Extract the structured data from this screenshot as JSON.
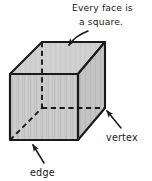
{
  "figure": {
    "shape_name": "cube",
    "projection": "oblique parallel projection",
    "background_color": "#ffffff",
    "ink_color": "#1a1a1a",
    "faces": {
      "front_fill": "#c9c9c9",
      "top_fill": "#cfcfcf",
      "right_fill": "#c2c2c2",
      "texture": "vertical pencil shading streaks"
    },
    "hidden_line_style": "dashed",
    "visible_line_style": "solid"
  },
  "annotations": {
    "face_note": {
      "line1": "Every face is",
      "line2": "a square.",
      "full_text": "Every face is a square.",
      "points_to": "top face",
      "arrow": "curved-arrow-down-left"
    },
    "vertex_note": {
      "label": "vertex",
      "points_to": "back right bottom corner",
      "arrow": "straight-arrow-up-left"
    },
    "edge_note": {
      "label": "edge",
      "points_to": "front bottom edge",
      "arrow": "straight-arrow-up-left"
    }
  },
  "geometry": {
    "front_face": {
      "top_left": [
        10,
        74
      ],
      "top_right": [
        78,
        74
      ],
      "bottom_right": [
        78,
        140
      ],
      "bottom_left": [
        10,
        140
      ]
    },
    "back_face": {
      "top_left": [
        42,
        42
      ],
      "top_right": [
        105,
        42
      ],
      "bottom_right": [
        105,
        108
      ],
      "bottom_left": [
        42,
        108
      ]
    }
  }
}
